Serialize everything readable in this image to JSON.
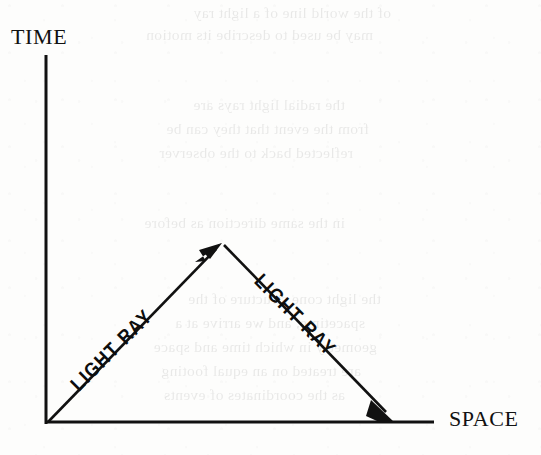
{
  "figure": {
    "kind": "spacetime-diagram",
    "background_color": "#fdfdfc",
    "ink_color": "#111111"
  },
  "axes": {
    "vertical": {
      "label": "TIME",
      "orientation": "vertical",
      "origin_px": [
        46,
        424
      ],
      "end_px": [
        46,
        55
      ],
      "stroke_width": 3
    },
    "horizontal": {
      "label": "SPACE",
      "orientation": "horizontal",
      "origin_px": [
        46,
        422
      ],
      "end_px": [
        434,
        422
      ],
      "stroke_width": 3
    }
  },
  "rays": [
    {
      "label": "LIGHT RAY",
      "direction": "up-right",
      "start_px": [
        47,
        423
      ],
      "end_px": [
        222,
        243
      ],
      "arrowhead_at": "end",
      "angle_deg": -45
    },
    {
      "label": "LIGHT RAY",
      "direction": "down-right",
      "start_px": [
        223,
        244
      ],
      "end_px": [
        393,
        421
      ],
      "arrowhead_at": "end",
      "angle_deg": 45
    }
  ],
  "vertex": {
    "name": "reflection-point",
    "position_px": [
      222,
      243
    ]
  },
  "show_through_text": {
    "note": "faint mirrored bleed-through from the reverse side of the page",
    "lines": [
      {
        "text": "of the world line of a light ray",
        "left": 150,
        "top": 4
      },
      {
        "text": "may be used to describe its motion",
        "left": 168,
        "top": 26
      },
      {
        "text": "the radial light rays are",
        "left": 196,
        "top": 96
      },
      {
        "text": "from the event that they can be",
        "left": 172,
        "top": 120
      },
      {
        "text": "reflected back to the observer",
        "left": 188,
        "top": 144
      },
      {
        "text": "in the same direction as before",
        "left": 196,
        "top": 214
      },
      {
        "text": "the light cone structure of the",
        "left": 160,
        "top": 290
      },
      {
        "text": "spacetime, and we arrive at a",
        "left": 176,
        "top": 314
      },
      {
        "text": "geometry in which time and space",
        "left": 164,
        "top": 338
      },
      {
        "text": "are treated on an equal footing",
        "left": 180,
        "top": 362
      },
      {
        "text": "as the coordinates of events",
        "left": 196,
        "top": 386
      }
    ]
  }
}
